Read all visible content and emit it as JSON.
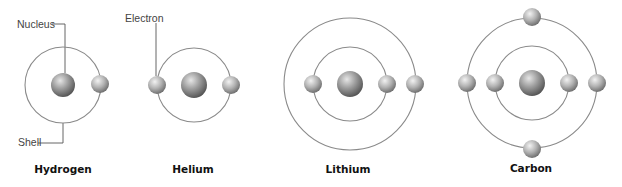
{
  "callouts": {
    "nucleus": "Nucleus",
    "electron": "Electron",
    "shell": "Shell"
  },
  "colors": {
    "shell_stroke": "#8a8a8a",
    "sphere_light": "#eeeeee",
    "sphere_mid": "#a8a8a8",
    "sphere_dark": "#5a5a5a",
    "label_text": "#111111",
    "callout_text": "#444444"
  },
  "atoms": [
    {
      "name": "Hydrogen",
      "center": [
        63,
        85
      ],
      "shells": [
        38
      ],
      "nucleus_r": 12,
      "electrons": [
        [
          100,
          84
        ]
      ]
    },
    {
      "name": "Helium",
      "center": [
        194,
        85
      ],
      "shells": [
        37
      ],
      "nucleus_r": 13,
      "electrons": [
        [
          157,
          85
        ],
        [
          231,
          85
        ]
      ]
    },
    {
      "name": "Lithium",
      "center": [
        350,
        84
      ],
      "shells": [
        37,
        66
      ],
      "nucleus_r": 13,
      "electrons": [
        [
          313,
          84
        ],
        [
          387,
          84
        ],
        [
          415,
          84
        ]
      ]
    },
    {
      "name": "Carbon",
      "center": [
        532,
        83
      ],
      "shells": [
        37,
        65
      ],
      "nucleus_r": 13,
      "electrons": [
        [
          495,
          83
        ],
        [
          569,
          83
        ],
        [
          467,
          83
        ],
        [
          597,
          83
        ],
        [
          532,
          17
        ],
        [
          532,
          149
        ]
      ]
    }
  ]
}
